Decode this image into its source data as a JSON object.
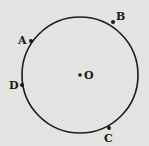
{
  "diagram": {
    "background": "#e3e3e1",
    "stroke_color": "#1a1a1a",
    "circle": {
      "cx": 80,
      "cy": 75,
      "r": 58
    },
    "center": {
      "label": "O",
      "x": 80,
      "y": 75,
      "label_x": 84,
      "label_y": 79
    },
    "points": [
      {
        "label": "A",
        "x": 31,
        "y": 41,
        "label_x": 18,
        "label_y": 44
      },
      {
        "label": "B",
        "x": 113,
        "y": 22,
        "label_x": 116,
        "label_y": 20
      },
      {
        "label": "D",
        "x": 22,
        "y": 85,
        "label_x": 9,
        "label_y": 89
      },
      {
        "label": "C",
        "x": 109,
        "y": 128,
        "label_x": 104,
        "label_y": 142
      }
    ]
  }
}
